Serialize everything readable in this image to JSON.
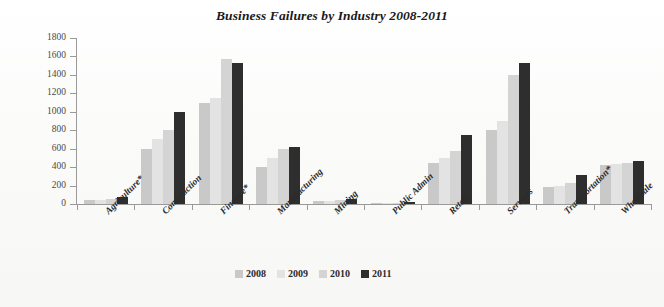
{
  "chart_data": {
    "type": "bar",
    "title": "Business Failures by Industry 2008-2011",
    "xlabel": "",
    "ylabel": "",
    "ylim": [
      0,
      1800
    ],
    "ytick_step": 200,
    "yticks": [
      "0",
      "200",
      "400",
      "600",
      "800",
      "1000",
      "1200",
      "1400",
      "1600",
      "1800"
    ],
    "grid": false,
    "legend_position": "bottom",
    "categories": [
      "Agriculture*",
      "Construction",
      "Finance*",
      "Manufacturing",
      "Mining",
      "Public Admin",
      "Retail",
      "Services",
      "Transportation*",
      "Wholesale"
    ],
    "series": [
      {
        "name": "2008",
        "color": "#c9c9c9",
        "values": [
          40,
          600,
          1100,
          400,
          30,
          10,
          450,
          800,
          180,
          420
        ]
      },
      {
        "name": "2009",
        "color": "#e3e3e3",
        "values": [
          45,
          700,
          1150,
          500,
          35,
          12,
          500,
          900,
          200,
          430
        ]
      },
      {
        "name": "2010",
        "color": "#d4d4d4",
        "values": [
          50,
          800,
          1570,
          600,
          40,
          15,
          570,
          1400,
          230,
          450
        ]
      },
      {
        "name": "2011",
        "color": "#2e2e2e",
        "values": [
          80,
          1000,
          1530,
          620,
          50,
          20,
          750,
          1530,
          310,
          470
        ]
      }
    ]
  },
  "legend": {
    "items": [
      {
        "label": "2008",
        "color": "#c9c9c9"
      },
      {
        "label": "2009",
        "color": "#e3e3e3"
      },
      {
        "label": "2010",
        "color": "#d4d4d4"
      },
      {
        "label": "2011",
        "color": "#2e2e2e"
      }
    ]
  }
}
